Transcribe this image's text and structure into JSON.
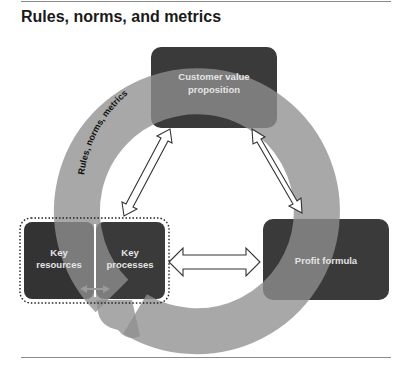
{
  "title": "Rules, norms, and metrics",
  "ring_label": "Rules, norms, metrics",
  "boxes": {
    "customer_value": {
      "line1": "Customer value",
      "line2": "proposition"
    },
    "key_resources": {
      "line1": "Key",
      "line2": "resources"
    },
    "key_processes": {
      "line1": "Key",
      "line2": "processes"
    },
    "profit_formula": {
      "line1": "Profit formula"
    }
  },
  "colors": {
    "box_fill": "#3a3a3a",
    "ring_fill": "#8f8f8f",
    "label_text": "#e4e4e4",
    "small_arrow": "#9a9a9a"
  },
  "connections": [
    {
      "from": "key_processes",
      "to": "customer_value",
      "type": "bidirectional"
    },
    {
      "from": "customer_value",
      "to": "profit_formula",
      "type": "bidirectional"
    },
    {
      "from": "key_processes",
      "to": "profit_formula",
      "type": "bidirectional"
    },
    {
      "from": "key_resources",
      "to": "key_processes",
      "type": "bidirectional"
    }
  ]
}
